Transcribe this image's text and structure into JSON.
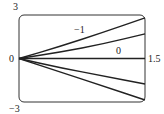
{
  "chart_data": {
    "type": "line",
    "title": "",
    "xlabel": "",
    "ylabel": "",
    "xlim": [
      0,
      1.5
    ],
    "ylim": [
      -3,
      3
    ],
    "grid": false,
    "tick_labels": {
      "y_top": "3",
      "y_bottom": "−3",
      "y_origin": "0",
      "x_right": "1.5"
    },
    "series": [
      {
        "name": "−1",
        "label_shown": true,
        "x": [
          0,
          0.5,
          1.0,
          1.5
        ],
        "y": [
          0,
          0.85,
          1.8,
          2.8
        ]
      },
      {
        "name": "0",
        "label_shown": true,
        "x": [
          0,
          0.5,
          1.0,
          1.5
        ],
        "y": [
          0,
          0.45,
          1.0,
          1.7
        ]
      },
      {
        "name": "curve-3",
        "label_shown": false,
        "x": [
          0,
          0.5,
          1.0,
          1.5
        ],
        "y": [
          0,
          0,
          0,
          0
        ]
      },
      {
        "name": "curve-4",
        "label_shown": false,
        "x": [
          0,
          0.5,
          1.0,
          1.5
        ],
        "y": [
          0,
          -0.65,
          -1.2,
          -1.76
        ]
      },
      {
        "name": "curve-5",
        "label_shown": false,
        "x": [
          0,
          0.5,
          1.0,
          1.5
        ],
        "y": [
          0,
          -0.95,
          -1.9,
          -2.86
        ]
      }
    ],
    "annotations": [
      {
        "text": "−1",
        "x": 0.92,
        "y": 2.0
      },
      {
        "text": "0",
        "x": 1.2,
        "y": 0.65
      }
    ]
  }
}
